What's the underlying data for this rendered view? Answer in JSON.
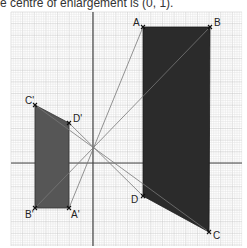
{
  "caption": "e centre of enlargement is (0, 1).",
  "colors": {
    "grid_minor": "#e3e3e3",
    "grid_major": "#c4c4c4",
    "axis": "#444444",
    "shape_object": "#2b2b2b",
    "shape_image": "#565656",
    "ray": "#777777",
    "label": "#222222"
  },
  "grid": {
    "x0": 11,
    "y0": 12,
    "x1": 242,
    "y1": 246,
    "minor": 2.33,
    "major_every": 5
  },
  "axes": {
    "y_axis_x": 93,
    "x_axis_y": 163
  },
  "centre": {
    "label": "centre of enlargement",
    "x": 93,
    "y": 147
  },
  "object_shape": {
    "name": "ABCD",
    "points": [
      {
        "label": "A",
        "x": 143,
        "y": 27
      },
      {
        "label": "B",
        "x": 210,
        "y": 27
      },
      {
        "label": "C",
        "x": 209,
        "y": 232
      },
      {
        "label": "D",
        "x": 143,
        "y": 196
      }
    ]
  },
  "image_shape": {
    "name": "A'B'C'D'",
    "points": [
      {
        "label": "A'",
        "x": 69,
        "y": 208
      },
      {
        "label": "B'",
        "x": 35,
        "y": 208
      },
      {
        "label": "C'",
        "x": 35,
        "y": 105
      },
      {
        "label": "D'",
        "x": 69,
        "y": 123
      }
    ]
  },
  "labels": [
    {
      "text": "A",
      "x": 133,
      "y": 26
    },
    {
      "text": "B",
      "x": 214,
      "y": 26
    },
    {
      "text": "C",
      "x": 213,
      "y": 239
    },
    {
      "text": "D",
      "x": 131,
      "y": 203
    },
    {
      "text": "A'",
      "x": 71,
      "y": 218
    },
    {
      "text": "B'",
      "x": 25,
      "y": 218
    },
    {
      "text": "C'",
      "x": 25,
      "y": 104
    },
    {
      "text": "D'",
      "x": 73,
      "y": 122
    }
  ]
}
